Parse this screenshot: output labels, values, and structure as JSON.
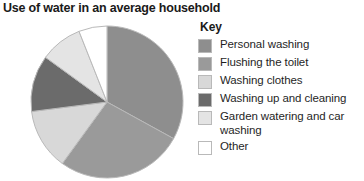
{
  "chart_title": "Use of water in an average household",
  "legend": {
    "title": "Key"
  },
  "chart_data": {
    "type": "pie",
    "title": "Use of water in an average household",
    "legend_title": "Key",
    "legend_position": "right",
    "start_angle_deg": 0,
    "direction": "clockwise",
    "categories": [
      "Personal washing",
      "Flushing the toilet",
      "Washing clothes",
      "Washing up and cleaning",
      "Garden watering and car washing",
      "Other"
    ],
    "values": [
      33,
      27,
      13,
      12,
      9,
      6
    ],
    "unit": "percent",
    "colors": [
      "#8e8e8e",
      "#9a9a9a",
      "#d8d8d8",
      "#6b6b6b",
      "#e4e4e4",
      "#ffffff"
    ],
    "slice_edge_color": "#b9b9b9",
    "slices": [
      {
        "label": "Personal washing",
        "value": 33,
        "color": "#8e8e8e"
      },
      {
        "label": "Flushing the toilet",
        "value": 27,
        "color": "#9a9a9a"
      },
      {
        "label": "Washing clothes",
        "value": 13,
        "color": "#d8d8d8"
      },
      {
        "label": "Washing up and cleaning",
        "value": 12,
        "color": "#6b6b6b"
      },
      {
        "label": "Garden watering and car washing",
        "value": 9,
        "color": "#e4e4e4"
      },
      {
        "label": "Other",
        "value": 6,
        "color": "#ffffff"
      }
    ]
  }
}
